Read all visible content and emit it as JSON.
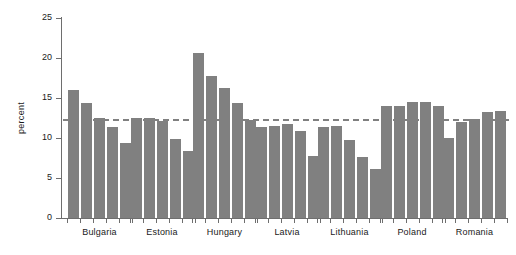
{
  "chart_data": {
    "type": "bar",
    "title": "",
    "subtitle": "",
    "xlabel": "",
    "ylabel": "percent",
    "ylim": [
      0,
      25
    ],
    "yticks": [
      0,
      5,
      10,
      15,
      20,
      25
    ],
    "ytick_labels": [
      "0",
      "5",
      "10",
      "15",
      "20",
      "25"
    ],
    "grid": false,
    "legend": "none",
    "bar_color": "#808080",
    "axis_color": "#6e6e6e",
    "categories": [
      "Bulgaria",
      "Estonia",
      "Hungary",
      "Latvia",
      "Lithuania",
      "Poland",
      "Romania"
    ],
    "bars_per_category": 5,
    "series": [
      {
        "name": "bar-1",
        "values": [
          16.0,
          12.5,
          20.6,
          11.4,
          11.4,
          14.0,
          10.0
        ]
      },
      {
        "name": "bar-2",
        "values": [
          14.4,
          12.5,
          17.7,
          11.5,
          11.5,
          14.0,
          12.0
        ]
      },
      {
        "name": "bar-3",
        "values": [
          12.5,
          12.1,
          16.2,
          11.7,
          9.8,
          14.5,
          12.4
        ]
      },
      {
        "name": "bar-4",
        "values": [
          11.4,
          9.9,
          14.4,
          10.9,
          7.6,
          14.5,
          13.2
        ]
      },
      {
        "name": "bar-5",
        "values": [
          9.4,
          8.4,
          12.2,
          7.8,
          6.1,
          14.0,
          13.4
        ]
      }
    ],
    "reference_line": {
      "value": 12.4,
      "style": "dashed",
      "color": "#808080"
    }
  }
}
